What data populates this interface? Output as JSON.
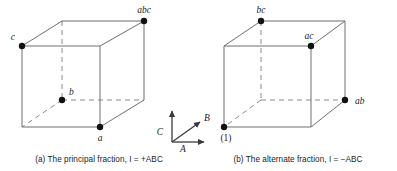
{
  "figure": {
    "type": "two-cube-fractional-factorial-diagram",
    "background_color": "#ffffff",
    "edge_color_solid": "#6e6e6e",
    "edge_color_dark": "#3a3a3a",
    "edge_color_dashed": "#8a8a8a",
    "point_color": "#111111",
    "label_color": "#1b1b1b"
  },
  "panel_a": {
    "caption_prefix": "(a)",
    "caption_text": "The principal fraction,",
    "caption_identity_lhs": "I",
    "caption_identity_eq": "=",
    "caption_identity_rhs": "+ABC",
    "caption_full": "(a) The principal fraction, I = +ABC",
    "points": [
      {
        "id": "c",
        "label": "c",
        "position": "front-top-left",
        "x": 22,
        "y": 46,
        "label_x": 17,
        "label_y": 38
      },
      {
        "id": "abc",
        "label": "abc",
        "position": "back-top-right",
        "x": 144,
        "y": 21,
        "label_x": 144,
        "label_y": 12
      },
      {
        "id": "b",
        "label": "b",
        "position": "back-bottom-left",
        "x": 62,
        "y": 100,
        "label_x": 69,
        "label_y": 93
      },
      {
        "id": "a",
        "label": "a",
        "position": "front-bottom-right",
        "x": 100,
        "y": 127,
        "label_x": 100,
        "label_y": 140
      }
    ]
  },
  "panel_b": {
    "caption_prefix": "(b)",
    "caption_text": "The alternate fraction,",
    "caption_identity_lhs": "I",
    "caption_identity_eq": "=",
    "caption_identity_rhs": "−ABC",
    "caption_full": "(b) The alternate fraction, I = −ABC",
    "points": [
      {
        "id": "bc",
        "label": "bc",
        "position": "back-top-left",
        "x": 62,
        "y": 21,
        "label_x": 62,
        "label_y": 12
      },
      {
        "id": "ac",
        "label": "ac",
        "position": "front-top-right",
        "x": 112,
        "y": 46,
        "label_x": 110,
        "label_y": 38
      },
      {
        "id": "(1)",
        "label": "(1)",
        "position": "front-bottom-left",
        "x": 25,
        "y": 127,
        "label_x": 27,
        "label_y": 140
      },
      {
        "id": "ab",
        "label": "ab",
        "position": "back-bottom-right",
        "x": 146,
        "y": 100,
        "label_x": 156,
        "label_y": 103
      }
    ]
  },
  "axis_triad": {
    "axes": [
      {
        "id": "C",
        "label": "C",
        "direction": "up",
        "label_x": 7,
        "label_y": 36
      },
      {
        "id": "B",
        "label": "B",
        "direction": "up-right",
        "label_x": 51,
        "label_y": 24
      },
      {
        "id": "A",
        "label": "A",
        "direction": "right",
        "label_x": 29,
        "label_y": 54
      }
    ]
  }
}
